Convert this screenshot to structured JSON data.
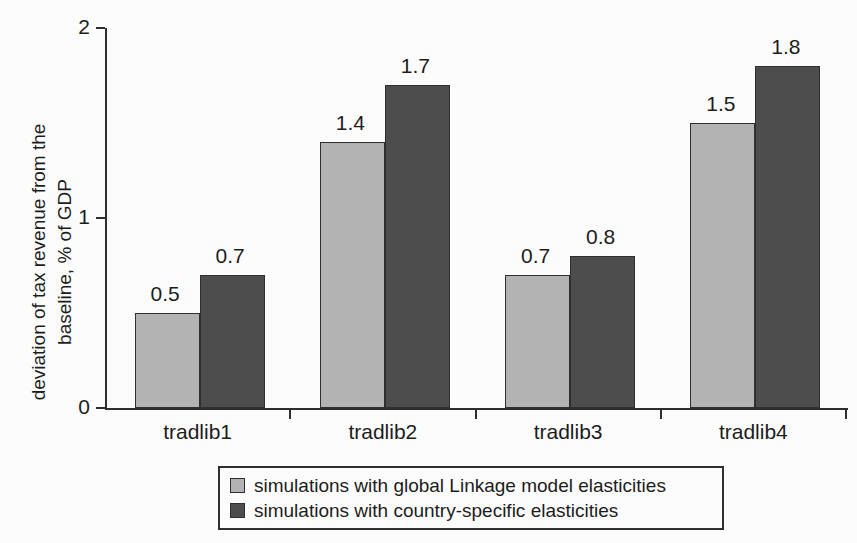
{
  "chart_data": {
    "type": "bar",
    "title": "",
    "categories": [
      "tradlib1",
      "tradlib2",
      "tradlib3",
      "tradlib4"
    ],
    "series": [
      {
        "name": "simulations with global Linkage model elasticities",
        "color": "#b3b3b3",
        "values": [
          0.5,
          1.4,
          0.7,
          1.5
        ]
      },
      {
        "name": "simulations with country-specific elasticities",
        "color": "#4d4d4d",
        "values": [
          0.7,
          1.7,
          0.8,
          1.8
        ]
      }
    ],
    "ylabel": "deviation of tax revenue from the baseline, % of GDP",
    "ylabel_line1": "deviation of tax revenue from the",
    "ylabel_line2": "baseline, % of GDP",
    "xlabel": "",
    "y_ticks": [
      "0",
      "1",
      "2"
    ],
    "ylim": [
      0,
      2
    ],
    "grid": false,
    "legend_position": "bottom-boxed",
    "data_labels_shown": true,
    "data_label_decimals": 1,
    "axis_color": "#2e2e2e",
    "text_color": "#1c1c1c"
  }
}
